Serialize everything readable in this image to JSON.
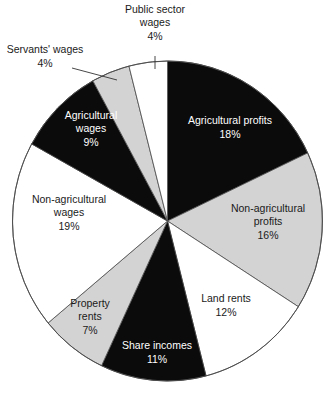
{
  "chart_data": {
    "type": "pie",
    "title": "",
    "start_angle_deg": 0,
    "direction": "clockwise",
    "center": [
      167.5,
      221
    ],
    "radius_x": 155,
    "radius_y": 160,
    "colors": {
      "black": "#0b0b0b",
      "gray": "#d3d3d3",
      "white": "#ffffff",
      "outline": "#4a4a4a"
    },
    "slices": [
      {
        "label": "Agricultural profits",
        "value": 18,
        "pct_label": "18%",
        "fill": "black",
        "text_color": "light",
        "label_lines": [
          "Agricultural profits",
          "18%"
        ],
        "label_pos": [
          230,
          127
        ]
      },
      {
        "label": "Non-agricultural profits",
        "value": 16,
        "pct_label": "16%",
        "fill": "gray",
        "text_color": "dark",
        "label_lines": [
          "Non-agricultural",
          "profits",
          "16%"
        ],
        "label_pos": [
          268,
          221
        ]
      },
      {
        "label": "Land rents",
        "value": 12,
        "pct_label": "12%",
        "fill": "white",
        "text_color": "dark",
        "label_lines": [
          "Land rents",
          "12%"
        ],
        "label_pos": [
          226,
          305
        ]
      },
      {
        "label": "Share incomes",
        "value": 11,
        "pct_label": "11%",
        "fill": "black",
        "text_color": "light",
        "label_lines": [
          "Share incomes",
          "11%"
        ],
        "label_pos": [
          157,
          352
        ]
      },
      {
        "label": "Property rents",
        "value": 7,
        "pct_label": "7%",
        "fill": "gray",
        "text_color": "dark",
        "label_lines": [
          "Property",
          "rents",
          "7%"
        ],
        "label_pos": [
          90,
          316
        ]
      },
      {
        "label": "Non-agricultural wages",
        "value": 19,
        "pct_label": "19%",
        "fill": "white",
        "text_color": "dark",
        "label_lines": [
          "Non-agricultural",
          "wages",
          "19%"
        ],
        "label_pos": [
          69,
          212
        ]
      },
      {
        "label": "Agricultural wages",
        "value": 9,
        "pct_label": "9%",
        "fill": "black",
        "text_color": "light",
        "label_lines": [
          "Agricultural",
          "wages",
          "9%"
        ],
        "label_pos": [
          91,
          128
        ]
      },
      {
        "label": "Servants' wages",
        "value": 4,
        "pct_label": "4%",
        "fill": "gray",
        "text_color": "dark",
        "label_lines": [
          "Servants' wages",
          "4%"
        ],
        "label_pos": [
          45,
          56
        ],
        "external": true,
        "leader": [
          [
            72,
            68
          ],
          [
            117,
            80
          ]
        ]
      },
      {
        "label": "Public sector wages",
        "value": 4,
        "pct_label": "4%",
        "fill": "white",
        "text_color": "dark",
        "label_lines": [
          "Public sector",
          "wages",
          "4%"
        ],
        "label_pos": [
          155,
          22
        ],
        "external": true,
        "leader": [
          [
            155,
            56
          ],
          [
            155,
            69
          ]
        ]
      }
    ]
  }
}
